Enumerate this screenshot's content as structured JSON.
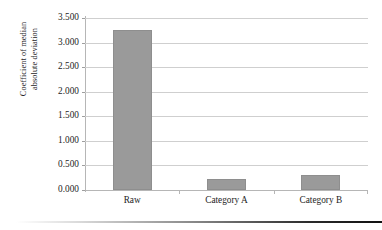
{
  "chart_data": {
    "type": "bar",
    "title": "",
    "subtitle": "",
    "xlabel": "",
    "ylabel": "Coefficient of median absolute deviation",
    "ylabel_lines": [
      "Coefficient of median",
      "absolute deviation"
    ],
    "categories": [
      "Raw",
      "Category A",
      "Category B"
    ],
    "values": [
      3.26,
      0.23,
      0.3
    ],
    "series": [
      {
        "name": "Coefficient of median absolute deviation",
        "values": [
          3.26,
          0.23,
          0.3
        ],
        "color": "#9a9a9a"
      }
    ],
    "ylim": [
      0.0,
      3.5
    ],
    "ytick_values": [
      0.0,
      0.5,
      1.0,
      1.5,
      2.0,
      2.5,
      3.0,
      3.5
    ],
    "ytick_labels": [
      "0.000",
      "0.500",
      "1.000",
      "1.500",
      "2.000",
      "2.500",
      "3.000",
      "3.500"
    ],
    "grid": true,
    "grid_axis": "y",
    "legend": false,
    "legend_position": "none",
    "bar_color": "#9a9a9a",
    "bar_border_color": "#8e8e8e",
    "gridline_color": "#cfcfcf",
    "axis_color": "#b6b6b6",
    "text_color": "#1d1d1d",
    "background": "#ffffff"
  },
  "figure": {
    "bottom_rule_present": true
  }
}
